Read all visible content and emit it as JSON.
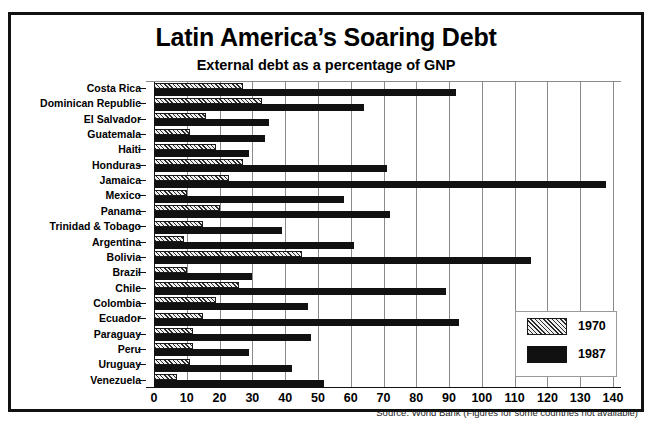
{
  "chart_data": {
    "type": "bar",
    "orientation": "horizontal",
    "title": "Latin America’s Soaring Debt",
    "subtitle": "External debt as a percentage of GNP",
    "xlabel": "",
    "ylabel": "",
    "xlim": [
      0,
      140
    ],
    "xticks": [
      0,
      10,
      20,
      30,
      40,
      50,
      60,
      70,
      80,
      90,
      100,
      110,
      120,
      130,
      140
    ],
    "grid": true,
    "legend_position": "inside-bottom-right",
    "categories": [
      "Costa Rica",
      "Dominican Republic",
      "El Salvador",
      "Guatemala",
      "Haiti",
      "Honduras",
      "Jamaica",
      "Mexico",
      "Panama",
      "Trinidad & Tobago",
      "Argentina",
      "Bolivia",
      "Brazil",
      "Chile",
      "Colombia",
      "Ecuador",
      "Paraguay",
      "Peru",
      "Uruguay",
      "Venezuela"
    ],
    "series": [
      {
        "name": "1970",
        "color": "#efefef",
        "pattern": "hatched",
        "values": [
          27,
          33,
          16,
          11,
          19,
          27,
          23,
          10,
          20,
          15,
          9,
          45,
          10,
          26,
          19,
          15,
          12,
          12,
          11,
          7
        ]
      },
      {
        "name": "1987",
        "color": "#111111",
        "pattern": "solid",
        "values": [
          92,
          64,
          35,
          34,
          29,
          71,
          138,
          58,
          72,
          39,
          61,
          115,
          30,
          89,
          47,
          93,
          48,
          29,
          42,
          52
        ]
      }
    ],
    "source_note": "Source: World Bank (Figures for some countries not available)"
  },
  "legend": {
    "items": [
      {
        "label": "1970"
      },
      {
        "label": "1987"
      }
    ]
  }
}
